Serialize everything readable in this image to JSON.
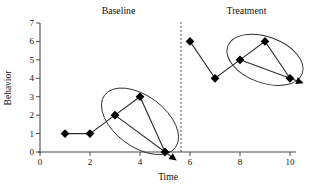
{
  "figure": {
    "background": "#ffffff",
    "text_color": "#111111",
    "line_color": "#2e2e2e",
    "axis_color": "#4a4a4a",
    "marker_color": "#000000"
  },
  "chart_data": {
    "type": "line",
    "title": "",
    "xlabel": "Time",
    "ylabel": "Behavior",
    "xlim": [
      0,
      10.2
    ],
    "ylim": [
      0,
      7
    ],
    "x_ticks": [
      0,
      2,
      4,
      6,
      8,
      10
    ],
    "y_ticks": [
      0,
      1,
      2,
      3,
      4,
      5,
      6,
      7
    ],
    "grid": false,
    "legend": "none",
    "marker": "diamond",
    "phase_divider": {
      "x": 5.64,
      "style": "dashed"
    },
    "series": [
      {
        "name": "Baseline",
        "x": [
          1,
          2,
          3,
          4,
          5
        ],
        "values": [
          1,
          1,
          2,
          3,
          0
        ]
      },
      {
        "name": "Treatment",
        "x": [
          6,
          7,
          8,
          9,
          10
        ],
        "values": [
          6,
          4,
          5,
          6,
          4
        ]
      }
    ],
    "annotations": [
      {
        "type": "ellipse-circled-points",
        "phase": "Baseline",
        "points": [
          [
            3,
            2
          ],
          [
            4,
            3
          ],
          [
            5,
            0
          ]
        ]
      },
      {
        "type": "trend-arrow",
        "phase": "Baseline",
        "from": [
          3,
          2
        ],
        "to": [
          5,
          0
        ]
      },
      {
        "type": "ellipse-circled-points",
        "phase": "Treatment",
        "points": [
          [
            8,
            5
          ],
          [
            9,
            6
          ],
          [
            10,
            4
          ]
        ]
      },
      {
        "type": "trend-arrow",
        "phase": "Treatment",
        "from": [
          8,
          5
        ],
        "to": [
          10,
          4
        ]
      }
    ]
  }
}
